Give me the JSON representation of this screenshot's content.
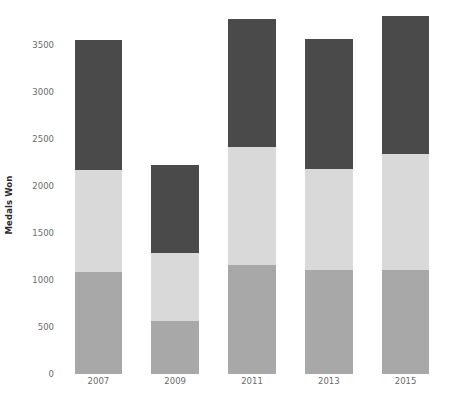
{
  "chart_data": {
    "type": "bar",
    "subtype": "stacked-bar",
    "title": "",
    "subtitle": "",
    "xlabel": "",
    "ylabel": "Medals Won",
    "categories": [
      "2007",
      "2009",
      "2011",
      "2013",
      "2015"
    ],
    "series": [
      {
        "name": "series-1",
        "color": "#a8a8a8",
        "values": [
          1090,
          565,
          1165,
          1110,
          1110
        ]
      },
      {
        "name": "series-2",
        "color": "#d9d9d9",
        "values": [
          1085,
          725,
          1245,
          1070,
          1230
        ]
      },
      {
        "name": "series-3",
        "color": "#4a4a4a",
        "values": [
          1375,
          935,
          1370,
          1385,
          1470
        ]
      }
    ],
    "totals": [
      3550,
      2225,
      3780,
      3565,
      3810
    ],
    "ylim": [
      0,
      3830
    ],
    "yticks": [
      0,
      500,
      1000,
      1500,
      2000,
      2500,
      3000,
      3500
    ],
    "ytick_labels": [
      "0",
      "500",
      "1000",
      "1500",
      "2000",
      "2500",
      "3000",
      "3500"
    ],
    "grid": false,
    "legend": false,
    "legend_position": "none",
    "background_color": "#ffffff",
    "tick_label_color": "#6b6b6b",
    "axis_label_color": "#2b2b2b"
  }
}
